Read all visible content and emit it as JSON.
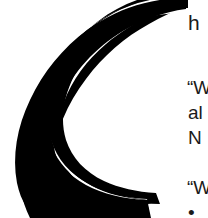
{
  "page": {
    "background_color": "#ffffff",
    "ink_color": "#000000",
    "text_color": "#1a1a1a",
    "width": 208,
    "height": 218
  },
  "dropcap": {
    "letter": "C",
    "icon_name": "dropcap-letter-c",
    "color": "#000000"
  },
  "body_text": {
    "continuation": {
      "text": "h",
      "note": "visible remainder of the word begun by the drop cap, clipped at right margin"
    },
    "paragraphs": [
      {
        "name": "quote-paragraph-1",
        "lines": [
          "“W",
          "al",
          "N"
        ]
      },
      {
        "name": "quote-paragraph-2",
        "lines": [
          "“W",
          "•"
        ]
      }
    ]
  }
}
